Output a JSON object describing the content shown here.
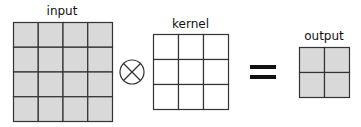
{
  "labels": {
    "input": "input",
    "kernel": "kernel",
    "output": "output"
  },
  "matrices": {
    "input": {
      "rows": 4,
      "cols": 4,
      "filled": true
    },
    "kernel": {
      "rows": 3,
      "cols": 3,
      "filled": false
    },
    "output": {
      "rows": 2,
      "cols": 2,
      "filled": true
    }
  },
  "operators": {
    "convolution": "circled-times-icon",
    "equals": "equals-icon"
  },
  "colors": {
    "cell_fill": "#d9d9d9",
    "grid_line": "#333333",
    "background": "#ffffff"
  }
}
